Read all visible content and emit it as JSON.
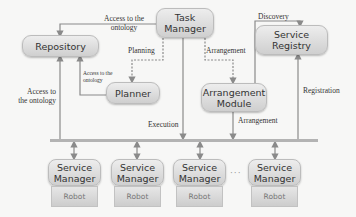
{
  "diagram": {
    "nodes": {
      "task_manager": "Task Manager",
      "repository": "Repository",
      "planner": "Planner",
      "arrangement_module": "Arrangement Module",
      "service_registry": "Service Registry"
    },
    "service_managers": [
      {
        "label": "Service Manager",
        "robot": "Robot"
      },
      {
        "label": "Service Manager",
        "robot": "Robot"
      },
      {
        "label": "Service Manager",
        "robot": "Robot"
      },
      {
        "label": "Service Manager",
        "robot": "Robot"
      }
    ],
    "ellipsis": "···",
    "edge_labels": {
      "tm_to_repo": "Access to the ontology",
      "tm_to_repo_line1": "Access to the",
      "tm_to_repo_line2": "ontology",
      "planning": "Planning",
      "arrangement_top": "Arrangement",
      "discovery": "Discovery",
      "planner_to_repo_line1": "Access to the",
      "planner_to_repo_line2": "ontology",
      "bus_to_repo_line1": "Access to",
      "bus_to_repo_line2": "the ontology",
      "execution": "Execution",
      "arrangement_bottom": "Arrangement",
      "registration": "Registration"
    },
    "colors": {
      "node_fill_top": "#ededed",
      "node_fill_bottom": "#cfcfcf",
      "line": "#8a8a8a",
      "background": "#f7f7f6"
    }
  }
}
